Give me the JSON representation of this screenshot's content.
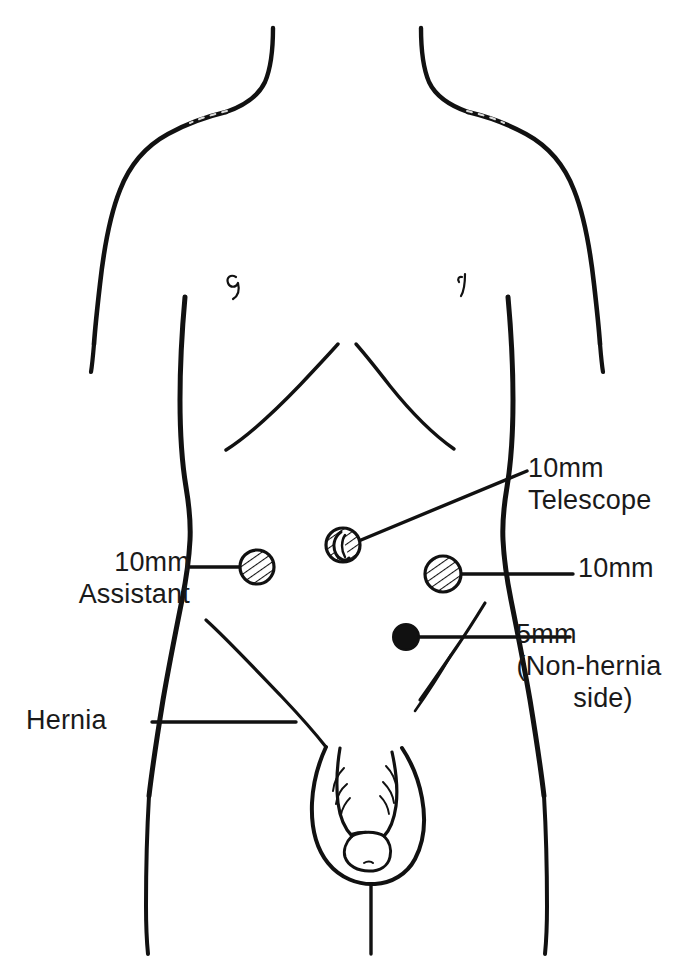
{
  "figure": {
    "kind": "anatomical-port-placement-diagram",
    "view": "frontal",
    "background_color": "#ffffff",
    "ink_color": "#111111"
  },
  "labels": {
    "assistant": {
      "line1": "10mm",
      "line2": "Assistant"
    },
    "telescope": {
      "line1": "10mm",
      "line2": "Telescope"
    },
    "right_10mm": {
      "line1": "10mm"
    },
    "five_mm": {
      "line1": "5mm",
      "line2": "(Non-hernia",
      "line3": "side)"
    },
    "hernia": {
      "line1": "Hernia"
    }
  },
  "ports": [
    {
      "id": "port-assistant",
      "label": "10mm Assistant",
      "size": "10mm",
      "marker": "hatched-circle",
      "cx": 257,
      "cy": 567,
      "r": 18
    },
    {
      "id": "port-telescope",
      "label": "10mm Telescope",
      "size": "10mm",
      "marker": "hatched-circle-umbilicus",
      "cx": 343,
      "cy": 545,
      "r": 18
    },
    {
      "id": "port-right-10mm",
      "label": "10mm",
      "size": "10mm",
      "marker": "hatched-circle",
      "cx": 443,
      "cy": 574,
      "r": 19
    },
    {
      "id": "port-5mm",
      "label": "5mm (Non-hernia side)",
      "size": "5mm",
      "marker": "solid-circle",
      "cx": 406,
      "cy": 637,
      "r": 13
    }
  ],
  "leaders": [
    {
      "id": "leader-assistant",
      "from": [
        190,
        567
      ],
      "to": [
        239,
        567
      ]
    },
    {
      "id": "leader-telescope",
      "from": [
        361,
        540
      ],
      "to": [
        527,
        471
      ]
    },
    {
      "id": "leader-right-10mm",
      "from": [
        462,
        574
      ],
      "to": [
        573,
        574
      ]
    },
    {
      "id": "leader-5mm",
      "from": [
        419,
        637
      ],
      "to": [
        570,
        637
      ]
    },
    {
      "id": "leader-hernia",
      "from": [
        152,
        722
      ],
      "to": [
        296,
        722
      ]
    }
  ],
  "anatomy_features": [
    "neck",
    "left-shoulder",
    "right-shoulder",
    "left-flank",
    "right-flank",
    "costal-margin",
    "left-nipple",
    "right-nipple",
    "umbilicus",
    "left-inguinal-crease",
    "right-inguinal-crease",
    "penis",
    "scrotum",
    "left-thigh",
    "right-thigh",
    "perineal-line"
  ]
}
